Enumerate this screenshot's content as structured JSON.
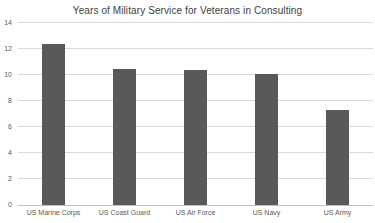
{
  "chart_data": {
    "type": "bar",
    "title": "Years of Military Service for Veterans in Consulting",
    "categories": [
      "US Marine Corps",
      "US Coast Guard",
      "US Air Force",
      "US Navy",
      "US Army"
    ],
    "values": [
      12.4,
      10.5,
      10.4,
      10.1,
      7.3
    ],
    "xlabel": "",
    "ylabel": "",
    "ylim": [
      0,
      14
    ],
    "ytick_step": 2,
    "ytick_labels": [
      "0",
      "2",
      "4",
      "6",
      "8",
      "10",
      "12",
      "14"
    ],
    "grid": true,
    "legend": false,
    "colors": {
      "bar": "#595959",
      "gridline": "#d9d9d9",
      "axis_line": "#bfbfbf",
      "tick_text": "#595959",
      "title_text": "#404040",
      "background": "#ffffff"
    }
  }
}
